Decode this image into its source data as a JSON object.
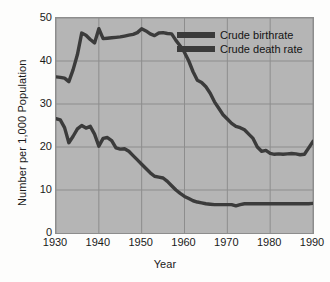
{
  "chart_data": {
    "type": "line",
    "title": "",
    "xlabel": "Year",
    "ylabel": "Number per 1,000 Population",
    "xlim": [
      1930,
      1990
    ],
    "ylim": [
      0,
      50
    ],
    "xticks": [
      1930,
      1940,
      1950,
      1960,
      1970,
      1980,
      1990
    ],
    "yticks": [
      0,
      10,
      20,
      30,
      40,
      50
    ],
    "grid": true,
    "legend_position": "upper-right-inside",
    "series": [
      {
        "name": "Crude birthrate",
        "color": "#3b3b3b",
        "x": [
          1930,
          1931,
          1932,
          1933,
          1934,
          1935,
          1936,
          1937,
          1938,
          1939,
          1940,
          1941,
          1942,
          1943,
          1944,
          1945,
          1946,
          1947,
          1948,
          1949,
          1950,
          1951,
          1952,
          1953,
          1954,
          1955,
          1956,
          1957,
          1958,
          1959,
          1960,
          1961,
          1962,
          1963,
          1964,
          1965,
          1966,
          1967,
          1968,
          1969,
          1970,
          1971,
          1972,
          1973,
          1974,
          1975,
          1976,
          1977,
          1978,
          1979,
          1980,
          1981,
          1982,
          1983,
          1984,
          1985,
          1986,
          1987,
          1988,
          1989,
          1990
        ],
        "values": [
          36.3,
          36.2,
          36.0,
          35.2,
          38.0,
          41.5,
          46.5,
          46.0,
          45.0,
          44.2,
          47.5,
          45.2,
          45.3,
          45.4,
          45.5,
          45.6,
          45.8,
          46.0,
          46.2,
          46.6,
          47.5,
          47.0,
          46.3,
          45.9,
          46.5,
          46.6,
          46.4,
          46.3,
          44.8,
          43.5,
          42.0,
          40.0,
          37.5,
          35.5,
          35.0,
          34.0,
          32.5,
          30.5,
          29.0,
          27.5,
          26.5,
          25.5,
          24.8,
          24.5,
          24.0,
          23.0,
          22.0,
          20.0,
          19.0,
          19.2,
          18.5,
          18.3,
          18.4,
          18.3,
          18.4,
          18.5,
          18.4,
          18.2,
          18.3,
          19.8,
          21.3
        ]
      },
      {
        "name": "Crude death rate",
        "color": "#3b3b3b",
        "x": [
          1930,
          1931,
          1932,
          1933,
          1934,
          1935,
          1936,
          1937,
          1938,
          1939,
          1940,
          1941,
          1942,
          1943,
          1944,
          1945,
          1946,
          1947,
          1948,
          1949,
          1950,
          1951,
          1952,
          1953,
          1954,
          1955,
          1956,
          1957,
          1958,
          1959,
          1960,
          1961,
          1962,
          1963,
          1964,
          1965,
          1966,
          1967,
          1968,
          1969,
          1970,
          1971,
          1972,
          1973,
          1974,
          1975,
          1976,
          1977,
          1978,
          1979,
          1980,
          1981,
          1982,
          1983,
          1984,
          1985,
          1986,
          1987,
          1988,
          1989,
          1990
        ],
        "values": [
          26.6,
          26.3,
          24.5,
          21.0,
          22.5,
          24.2,
          25.0,
          24.4,
          24.8,
          23.0,
          20.2,
          22.0,
          22.2,
          21.5,
          19.8,
          19.5,
          19.6,
          19.0,
          18.0,
          17.0,
          16.0,
          15.0,
          14.0,
          13.2,
          13.0,
          12.8,
          12.0,
          11.0,
          10.0,
          9.2,
          8.5,
          8.0,
          7.5,
          7.2,
          7.0,
          6.8,
          6.7,
          6.6,
          6.6,
          6.6,
          6.6,
          6.6,
          6.3,
          6.6,
          6.8,
          6.8,
          6.8,
          6.8,
          6.8,
          6.8,
          6.8,
          6.8,
          6.8,
          6.8,
          6.8,
          6.8,
          6.8,
          6.8,
          6.8,
          6.8,
          6.9
        ]
      }
    ]
  },
  "legend": {
    "items": [
      {
        "label": "Crude birthrate"
      },
      {
        "label": "Crude death rate"
      }
    ]
  },
  "axes": {
    "x_title": "Year",
    "y_title": "Number per 1,000 Population",
    "x_tick_labels": [
      "1930",
      "1940",
      "1950",
      "1960",
      "1970",
      "1980",
      "1990"
    ],
    "y_tick_labels": [
      "0",
      "10",
      "20",
      "30",
      "40",
      "50"
    ]
  },
  "colors": {
    "plot_background": "#b5b5b5",
    "gridline": "#8d8d8d",
    "line": "#3b3b3b",
    "page_background": "#fdfdfc",
    "text": "#1a1a1a"
  }
}
